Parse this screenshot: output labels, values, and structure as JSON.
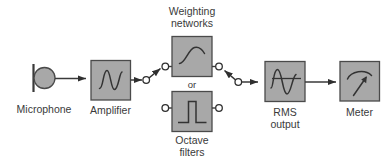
{
  "diagram": {
    "colors": {
      "background": "#ffffff",
      "block_fill": "#a8a8a8",
      "block_stroke": "#4a4a4a",
      "line": "#3a3a3a",
      "text": "#3a3a3a",
      "contact_fill": "#ffffff"
    },
    "blocks": [
      {
        "id": "microphone",
        "label": "Microphone",
        "icon": "microphone-capsule-icon",
        "shape": "circle-with-baffle"
      },
      {
        "id": "amplifier",
        "label": "Amplifier",
        "icon": "sine-wave-icon",
        "shape": "rect"
      },
      {
        "id": "weighting-networks",
        "label": "Weighting\nnetworks",
        "label_line1": "Weighting",
        "label_line2": "networks",
        "icon": "frequency-response-curve-icon",
        "shape": "rect"
      },
      {
        "id": "octave-filters",
        "label": "Octave\nfilters",
        "label_line1": "Octave",
        "label_line2": "filters",
        "icon": "square-pulse-icon",
        "shape": "rect"
      },
      {
        "id": "rms-output",
        "label": "RMS\noutput",
        "label_line1": "RMS",
        "label_line2": "output",
        "icon": "rms-sine-with-mean-line-icon",
        "shape": "rect"
      },
      {
        "id": "meter",
        "label": "Meter",
        "icon": "analog-needle-gauge-icon",
        "shape": "rect"
      }
    ],
    "connectors": {
      "or_label": "or",
      "switch_left": "spdt-switch-left",
      "switch_right": "spdt-switch-right",
      "arrowheads": 4
    }
  }
}
